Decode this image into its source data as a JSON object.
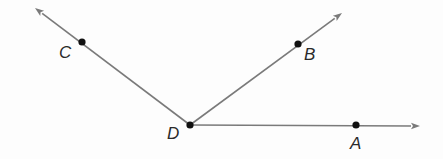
{
  "diagram": {
    "type": "angle-rays",
    "vertex": {
      "label": "D",
      "x": 190,
      "y": 125,
      "label_x": 167,
      "label_y": 139
    },
    "rays": [
      {
        "name": "ray-DC",
        "point": {
          "label": "C",
          "x": 82,
          "y": 42,
          "label_x": 59,
          "label_y": 58
        },
        "tip": {
          "x": 35,
          "y": 8
        }
      },
      {
        "name": "ray-DB",
        "point": {
          "label": "B",
          "x": 298,
          "y": 44,
          "label_x": 304,
          "label_y": 60
        },
        "tip": {
          "x": 342,
          "y": 13
        }
      },
      {
        "name": "ray-DA",
        "point": {
          "label": "A",
          "x": 356,
          "y": 125,
          "label_x": 350,
          "label_y": 149
        },
        "tip": {
          "x": 420,
          "y": 126
        }
      }
    ],
    "colors": {
      "ray": "#7a7a7a",
      "point": "#111111",
      "label": "#2a2a2a",
      "background": "#fdfdfd"
    }
  }
}
